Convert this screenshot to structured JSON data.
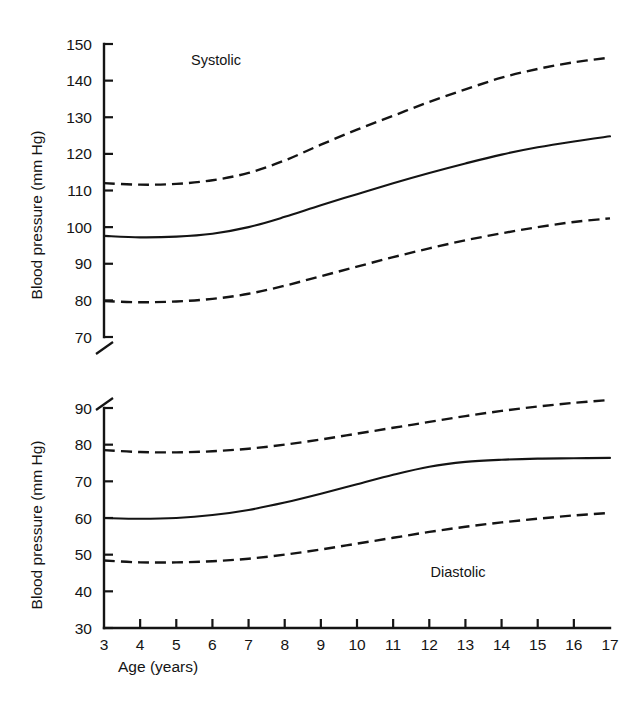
{
  "figure": {
    "title": "",
    "y_axis_label": "Blood pressure (mm Hg)",
    "x_axis_label": "Age (years)",
    "background_color": "#ffffff",
    "line_color": "#141414"
  },
  "chart_data": {
    "type": "line",
    "xlabel": "Age (years)",
    "ylabel": "Blood pressure (mm Hg)",
    "x": [
      3,
      4,
      5,
      6,
      7,
      8,
      9,
      10,
      11,
      12,
      13,
      14,
      15,
      16,
      17
    ],
    "xlim": [
      3,
      17
    ],
    "xticks": [
      3,
      4,
      5,
      6,
      7,
      8,
      9,
      10,
      11,
      12,
      13,
      14,
      15,
      16,
      17
    ],
    "grid": false,
    "legend": "none",
    "panels": [
      {
        "name": "systolic",
        "label": "Systolic",
        "label_position": "top-left",
        "ylim": [
          70,
          150
        ],
        "yticks": [
          70,
          80,
          90,
          100,
          110,
          120,
          130,
          140,
          150
        ],
        "axis_break_below": true,
        "series": [
          {
            "name": "upper-percentile",
            "style": "dashed",
            "values": [
              112.0,
              111.6,
              111.8,
              112.8,
              114.8,
              118.2,
              122.5,
              126.6,
              130.4,
              134.2,
              137.6,
              140.8,
              143.2,
              145.0,
              146.3
            ]
          },
          {
            "name": "median",
            "style": "solid",
            "values": [
              97.6,
              97.2,
              97.4,
              98.2,
              100.0,
              102.8,
              106.0,
              109.0,
              112.0,
              114.8,
              117.4,
              119.8,
              121.8,
              123.4,
              124.8
            ]
          },
          {
            "name": "lower-percentile",
            "style": "dashed",
            "values": [
              79.8,
              79.5,
              79.7,
              80.4,
              81.8,
              84.0,
              86.6,
              89.2,
              91.8,
              94.2,
              96.4,
              98.3,
              100.0,
              101.4,
              102.4
            ]
          }
        ]
      },
      {
        "name": "diastolic",
        "label": "Diastolic",
        "label_position": "bottom-right",
        "ylim": [
          30,
          90
        ],
        "yticks": [
          30,
          40,
          50,
          60,
          70,
          80,
          90
        ],
        "axis_break_above": true,
        "series": [
          {
            "name": "upper-percentile",
            "style": "dashed",
            "values": [
              78.5,
              78.0,
              77.9,
              78.2,
              78.9,
              80.0,
              81.4,
              83.0,
              84.6,
              86.2,
              87.8,
              89.2,
              90.4,
              91.4,
              92.2
            ]
          },
          {
            "name": "median",
            "style": "solid",
            "values": [
              60.0,
              59.8,
              60.0,
              60.8,
              62.2,
              64.2,
              66.6,
              69.2,
              71.8,
              74.0,
              75.3,
              75.9,
              76.2,
              76.3,
              76.4
            ]
          },
          {
            "name": "lower-percentile",
            "style": "dashed",
            "values": [
              48.4,
              47.9,
              47.9,
              48.2,
              48.9,
              50.0,
              51.4,
              53.0,
              54.6,
              56.2,
              57.6,
              58.8,
              59.8,
              60.7,
              61.4
            ]
          }
        ]
      }
    ]
  }
}
